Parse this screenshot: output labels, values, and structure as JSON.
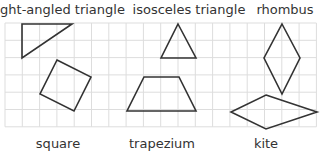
{
  "labels": {
    "right_angled_triangle": "right-angled triangle",
    "isosceles_triangle": "isosceles triangle",
    "rhombus": "rhombus",
    "square": "square",
    "trapezium": "trapezium",
    "kite": "kite"
  },
  "grid": {
    "x0": 5,
    "y0": 23,
    "cell": 17.3,
    "cols": 18,
    "rows": 6,
    "color": "#dddddd"
  },
  "shape_color": "#333333",
  "shapes": {
    "right_angled_triangle": "22,24 72,24 22,58",
    "square": "57,60 91,77 74,111 40,94",
    "isosceles_triangle": "178,24 196,58 161,58",
    "trapezium": "144,77 179,77 196,111 127,111",
    "rhombus": "282,24 300,58 282,94 264,58",
    "kite": "266,95 317,112 266,129 231,112"
  }
}
